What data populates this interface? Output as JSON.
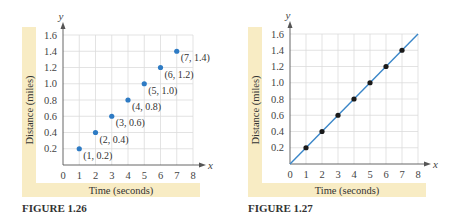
{
  "colors": {
    "band": "#f8ecc4",
    "grid": "#dcdcdc",
    "point_blue": "#2e7bc4",
    "point_black": "#1a1a1a",
    "line": "#3a86c8",
    "axis": "#555555"
  },
  "chart_data": [
    {
      "type": "scatter",
      "figure_label": "FIGURE 1.26",
      "xlabel": "Time (seconds)",
      "ylabel": "Distance (miles)",
      "x_axis_var": "x",
      "y_axis_var": "y",
      "xlim": [
        0,
        8
      ],
      "ylim": [
        0,
        1.6
      ],
      "x_ticks": [
        "0",
        "1",
        "2",
        "3",
        "4",
        "5",
        "6",
        "7",
        "8"
      ],
      "y_ticks": [
        "0.2",
        "0.4",
        "0.6",
        "0.8",
        "1.0",
        "1.2",
        "1.4",
        "1.6"
      ],
      "grid": true,
      "points": [
        {
          "x": 1,
          "y": 0.2,
          "label": "(1, 0.2)"
        },
        {
          "x": 2,
          "y": 0.4,
          "label": "(2, 0.4)"
        },
        {
          "x": 3,
          "y": 0.6,
          "label": "(3, 0.6)"
        },
        {
          "x": 4,
          "y": 0.8,
          "label": "(4, 0.8)"
        },
        {
          "x": 5,
          "y": 1.0,
          "label": "(5, 1.0)"
        },
        {
          "x": 6,
          "y": 1.2,
          "label": "(6, 1.2)"
        },
        {
          "x": 7,
          "y": 1.4,
          "label": "(7, 1.4)"
        }
      ]
    },
    {
      "type": "line",
      "figure_label": "FIGURE 1.27",
      "xlabel": "Time (seconds)",
      "ylabel": "Distance (miles)",
      "x_axis_var": "x",
      "y_axis_var": "y",
      "xlim": [
        0,
        8
      ],
      "ylim": [
        0,
        1.6
      ],
      "x_ticks": [
        "0",
        "1",
        "2",
        "3",
        "4",
        "5",
        "6",
        "7",
        "8"
      ],
      "y_ticks": [
        "0.2",
        "0.4",
        "0.6",
        "0.8",
        "1.0",
        "1.2",
        "1.4",
        "1.6"
      ],
      "grid": true,
      "line": {
        "x": [
          0,
          8
        ],
        "y": [
          0,
          1.6
        ]
      },
      "points": [
        {
          "x": 1,
          "y": 0.2
        },
        {
          "x": 2,
          "y": 0.4
        },
        {
          "x": 3,
          "y": 0.6
        },
        {
          "x": 4,
          "y": 0.8
        },
        {
          "x": 5,
          "y": 1.0
        },
        {
          "x": 6,
          "y": 1.2
        },
        {
          "x": 7,
          "y": 1.4
        }
      ]
    }
  ]
}
